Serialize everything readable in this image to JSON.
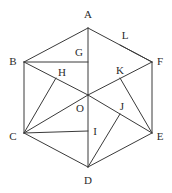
{
  "figure": {
    "shape": "hexagon",
    "canvas": {
      "width": 172,
      "height": 193
    },
    "background_color": "#ffffff",
    "line_color": "#3a3a3a",
    "label_color": "#2b2b2b",
    "line_width": 1,
    "points": {
      "A": {
        "label": "A",
        "x": 88,
        "y": 28,
        "label_x": 88,
        "label_y": 14,
        "kind": "vertex"
      },
      "B": {
        "label": "B",
        "x": 24,
        "y": 62,
        "label_x": 13,
        "label_y": 61,
        "kind": "vertex"
      },
      "C": {
        "label": "C",
        "x": 24,
        "y": 133,
        "label_x": 13,
        "label_y": 136,
        "kind": "vertex"
      },
      "D": {
        "label": "D",
        "x": 88,
        "y": 167,
        "label_x": 88,
        "label_y": 180,
        "kind": "vertex"
      },
      "E": {
        "label": "E",
        "x": 152,
        "y": 133,
        "label_x": 160,
        "label_y": 136,
        "kind": "vertex"
      },
      "F": {
        "label": "F",
        "x": 152,
        "y": 62,
        "label_x": 160,
        "label_y": 61,
        "kind": "vertex"
      },
      "O": {
        "label": "O",
        "x": 88,
        "y": 95,
        "label_x": 80,
        "label_y": 108,
        "kind": "centre"
      },
      "G": {
        "label": "G",
        "x": 88,
        "y": 62,
        "label_x": 79,
        "label_y": 52,
        "kind": "interior"
      },
      "H": {
        "label": "H",
        "x": 56,
        "y": 78,
        "label_x": 62,
        "label_y": 72,
        "kind": "interior"
      },
      "I": {
        "label": "I",
        "x": 88,
        "y": 131,
        "label_x": 95,
        "label_y": 131,
        "kind": "interior"
      },
      "J": {
        "label": "J",
        "x": 120,
        "y": 114,
        "label_x": 122,
        "label_y": 106,
        "kind": "interior"
      },
      "K": {
        "label": "K",
        "x": 120,
        "y": 78,
        "label_x": 120,
        "label_y": 70,
        "kind": "interior"
      },
      "L": {
        "label": "L",
        "x": 120,
        "y": 45,
        "label_x": 125,
        "label_y": 35,
        "kind": "interior"
      }
    },
    "edges": [
      {
        "name": "edge-AB",
        "from": "A",
        "to": "B"
      },
      {
        "name": "edge-BC",
        "from": "B",
        "to": "C"
      },
      {
        "name": "edge-CD",
        "from": "C",
        "to": "D"
      },
      {
        "name": "edge-DE",
        "from": "D",
        "to": "E"
      },
      {
        "name": "edge-EF",
        "from": "E",
        "to": "F"
      },
      {
        "name": "edge-FA",
        "from": "F",
        "to": "A"
      }
    ],
    "chords": [
      {
        "name": "chord-AO",
        "from": "A",
        "to": "O"
      },
      {
        "name": "chord-BO",
        "from": "B",
        "to": "O"
      },
      {
        "name": "chord-CO",
        "from": "C",
        "to": "O"
      },
      {
        "name": "chord-DO",
        "from": "D",
        "to": "O"
      },
      {
        "name": "chord-EO",
        "from": "E",
        "to": "O"
      },
      {
        "name": "chord-FO",
        "from": "F",
        "to": "O"
      },
      {
        "name": "chord-BG",
        "from": "B",
        "to": "G"
      },
      {
        "name": "chord-CH",
        "from": "C",
        "to": "H"
      },
      {
        "name": "chord-CI",
        "from": "C",
        "to": "I"
      },
      {
        "name": "chord-DJ",
        "from": "D",
        "to": "J"
      },
      {
        "name": "chord-EK",
        "from": "E",
        "to": "K"
      },
      {
        "name": "chord-FL",
        "from": "F",
        "to": "L"
      }
    ]
  }
}
